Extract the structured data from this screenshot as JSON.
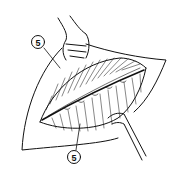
{
  "figure": {
    "type": "line-illustration",
    "background": "#ffffff",
    "ink": "#111111"
  },
  "callouts": [
    {
      "label": "5",
      "position": "upper-left",
      "points_to": "upper wound edge / tissue layer"
    },
    {
      "label": "5",
      "position": "bottom-center",
      "points_to": "lower wound edge / tissue layer"
    }
  ]
}
